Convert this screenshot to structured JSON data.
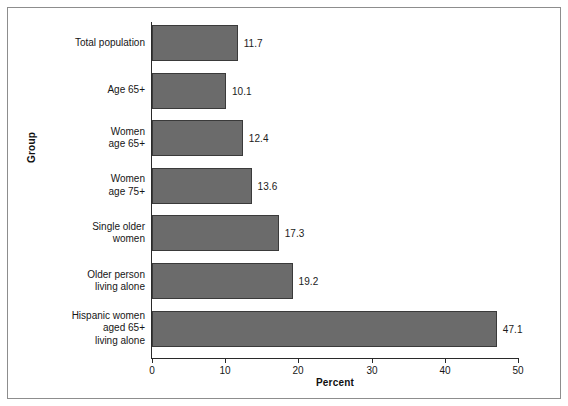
{
  "figure": {
    "background_color": "#ffffff",
    "frame_color": "#8d8d8d",
    "bar_fill_color": "#6b6b6b",
    "bar_edge_color": "#3a3a3a",
    "axis_color": "#2a2a2a"
  },
  "chart_data": {
    "type": "bar",
    "orientation": "horizontal",
    "title": "",
    "xlabel": "Percent",
    "ylabel": "Group",
    "xlim": [
      0,
      50
    ],
    "xticks": [
      0,
      10,
      20,
      30,
      40,
      50
    ],
    "xtick_labels": [
      "0",
      "10",
      "20",
      "30",
      "40",
      "50"
    ],
    "grid": false,
    "legend": null,
    "categories": [
      "Total population",
      "Age 65+",
      "Women\nage 65+",
      "Women\nage 75+",
      "Single older\nwomen",
      "Older person\nliving alone",
      "Hispanic women\naged 65+\nliving alone"
    ],
    "values": [
      11.7,
      10.1,
      12.4,
      13.6,
      17.3,
      19.2,
      47.1
    ],
    "value_labels": [
      "11.7",
      "10.1",
      "12.4",
      "13.6",
      "17.3",
      "19.2",
      "47.1"
    ]
  }
}
